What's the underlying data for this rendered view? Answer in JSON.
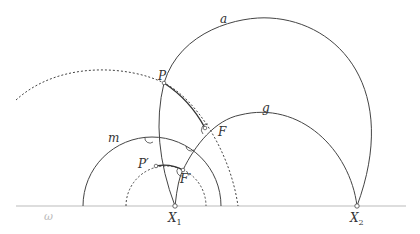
{
  "diagram": {
    "type": "hyperbolic-geometry-construction",
    "colors": {
      "stroke": "#444444",
      "baseline": "#bbbbbb",
      "background": "#ffffff"
    },
    "labels": {
      "a": "a",
      "g": "g",
      "m": "m",
      "omega": "ω",
      "P": "P",
      "F": "F",
      "P_prime": "P′",
      "F_prime": "F′",
      "X1_base": "X",
      "X1_sub": "1",
      "X2_base": "X",
      "X2_sub": "2"
    },
    "points": {
      "X1": [
        175,
        206
      ],
      "X2": [
        357,
        206
      ],
      "P": [
        164,
        83
      ],
      "F": [
        205,
        128
      ],
      "P_prime": [
        156,
        166
      ],
      "F_prime": [
        183,
        170
      ]
    }
  }
}
